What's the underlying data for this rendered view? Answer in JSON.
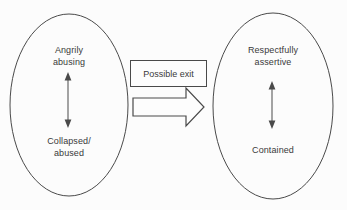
{
  "colors": {
    "bg": "#fcfcfc",
    "line": "#4a4a4a",
    "text": "#3a3a3a",
    "box_fill": "#fdfdfd"
  },
  "left_ellipse": {
    "top_label": "Angrily\nabusing",
    "bottom_label": "Collapsed/\nabused",
    "arrow_icon": "vertical-double-arrow-icon"
  },
  "connector": {
    "box_label": "Possible exit",
    "arrow_icon": "right-block-arrow-icon"
  },
  "right_ellipse": {
    "top_label": "Respectfully\nassertive",
    "bottom_label": "Contained",
    "arrow_icon": "vertical-double-arrow-icon"
  }
}
